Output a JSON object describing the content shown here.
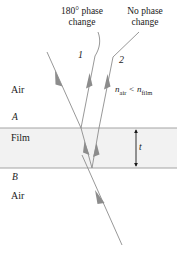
{
  "figure": {
    "type": "thin-film-interference-diagram",
    "background_color": "#ffffff",
    "ray_color": "#8c8c8c",
    "line_color": "#9a9a9a",
    "text_color": "#1a1a1a",
    "film_fill": "#f2f2f2"
  },
  "callouts": {
    "left": {
      "line1": "180° phase",
      "line2": "change"
    },
    "right": {
      "line1": "No phase",
      "line2": "change"
    }
  },
  "rays": {
    "ray_one_label": "1",
    "ray_two_label": "2"
  },
  "media": {
    "top_label": "Air",
    "film_label": "Film",
    "bottom_label": "Air"
  },
  "interfaces": {
    "top_label": "A",
    "bottom_label": "B"
  },
  "index_relation": {
    "n_symbol_left": "n",
    "sub_left": "air",
    "operator": "<",
    "n_symbol_right": "n",
    "sub_right": "film"
  },
  "thickness": {
    "label": "t"
  }
}
